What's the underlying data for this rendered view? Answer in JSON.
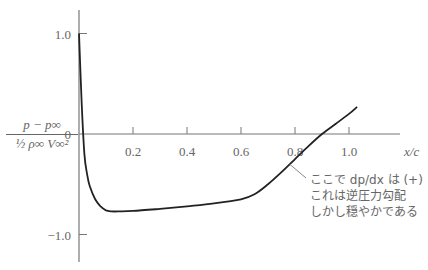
{
  "chart_data": {
    "type": "line",
    "title": "",
    "xlabel": "x/c",
    "ylabel": "(p - p∞) / (½ ρ∞ V∞²)",
    "ylabel_numerator": "p − p∞",
    "ylabel_denominator": "½ ρ∞ V∞²",
    "xlim": [
      0,
      1.15
    ],
    "ylim": [
      -1.3,
      1.25
    ],
    "grid": false,
    "legend": null,
    "x_ticks": [
      0.2,
      0.4,
      0.6,
      0.8,
      1.0
    ],
    "x_tick_labels": [
      "0.2",
      "0.4",
      "0.6",
      "0.8",
      "1.0"
    ],
    "y_ticks": [
      1.0,
      0,
      -1.0
    ],
    "y_tick_labels": [
      "1.0",
      "0",
      "−1.0"
    ],
    "series": [
      {
        "name": "pressure coefficient",
        "x": [
          0.0,
          0.01,
          0.02,
          0.03,
          0.04,
          0.06,
          0.08,
          0.1,
          0.12,
          0.15,
          0.2,
          0.3,
          0.4,
          0.5,
          0.6,
          0.65,
          0.7,
          0.75,
          0.8,
          0.85,
          0.9,
          0.95,
          1.0,
          1.03
        ],
        "values": [
          1.0,
          0.3,
          -0.2,
          -0.4,
          -0.52,
          -0.65,
          -0.72,
          -0.76,
          -0.77,
          -0.77,
          -0.765,
          -0.745,
          -0.72,
          -0.69,
          -0.65,
          -0.6,
          -0.5,
          -0.38,
          -0.25,
          -0.12,
          0.0,
          0.1,
          0.2,
          0.27
        ]
      }
    ],
    "annotation": {
      "lines": [
        "ここで dp/dx は (+)",
        "これは逆圧力勾配",
        "しかし穏やかである"
      ],
      "points_to": {
        "x": 0.78,
        "y": -0.3
      }
    }
  }
}
